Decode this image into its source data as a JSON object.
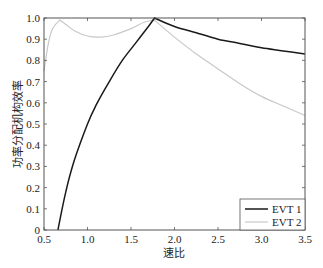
{
  "chart_data": {
    "type": "line",
    "title": "",
    "xlabel": "速比",
    "ylabel": "功率分配机构效率",
    "xlim": [
      0.5,
      3.5
    ],
    "ylim": [
      0,
      1.0
    ],
    "grid": false,
    "legend_position": "lower right",
    "x_ticks": [
      "0.5",
      "1.0",
      "1.5",
      "2.0",
      "2.5",
      "3.0",
      "3.5"
    ],
    "y_ticks": [
      "0",
      "0.1",
      "0.2",
      "0.3",
      "0.4",
      "0.5",
      "0.6",
      "0.7",
      "0.8",
      "0.9",
      "1.0"
    ],
    "series": [
      {
        "name": "EVT 1",
        "color": "#1a1a1a",
        "x": [
          0.66,
          0.75,
          0.85,
          1.0,
          1.1,
          1.25,
          1.4,
          1.55,
          1.7,
          1.77,
          2.0,
          2.25,
          2.5,
          2.75,
          3.0,
          3.25,
          3.5
        ],
        "y": [
          0.0,
          0.18,
          0.33,
          0.5,
          0.59,
          0.7,
          0.8,
          0.88,
          0.96,
          1.0,
          0.96,
          0.93,
          0.9,
          0.88,
          0.86,
          0.845,
          0.83
        ]
      },
      {
        "name": "EVT 2",
        "color": "#c8c8c8",
        "x": [
          0.5,
          0.55,
          0.6,
          0.68,
          0.75,
          0.85,
          1.0,
          1.15,
          1.3,
          1.5,
          1.65,
          1.77,
          2.0,
          2.25,
          2.5,
          2.75,
          3.0,
          3.25,
          3.5
        ],
        "y": [
          0.75,
          0.88,
          0.95,
          0.99,
          0.97,
          0.94,
          0.915,
          0.91,
          0.92,
          0.95,
          0.98,
          0.99,
          0.91,
          0.83,
          0.76,
          0.69,
          0.63,
          0.585,
          0.54
        ]
      }
    ]
  }
}
